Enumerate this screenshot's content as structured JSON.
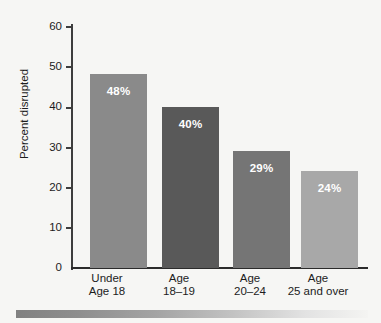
{
  "chart_data": {
    "type": "bar",
    "title": "",
    "xlabel": "",
    "ylabel": "Percent disrupted",
    "ylim": [
      0,
      60
    ],
    "yticks": [
      0,
      10,
      20,
      30,
      40,
      50,
      60
    ],
    "ytick_labels": [
      "0",
      "10",
      "20",
      "30",
      "40",
      "50",
      "60"
    ],
    "grid": false,
    "legend": "none",
    "categories": [
      "Under Age 18",
      "Age 18–19",
      "Age 20–24",
      "Age 25 and over"
    ],
    "category_lines": [
      [
        "Under",
        "Age 18"
      ],
      [
        "Age",
        "18–19"
      ],
      [
        "Age",
        "20–24"
      ],
      [
        "Age",
        "25 and over"
      ]
    ],
    "values": [
      48,
      40,
      29,
      24
    ],
    "value_labels": [
      "48%",
      "40%",
      "29%",
      "24%"
    ],
    "bar_colors": [
      "#8a8a8a",
      "#595959",
      "#757575",
      "#a8a8a8"
    ],
    "value_label_color": "#ffffff"
  },
  "figure": {
    "background_color": "#f6f6f4",
    "axis_color": "#2b2b2b",
    "text_color": "#1c1c1c",
    "bottom_rule": {
      "name": "decorative-gradient-rule",
      "from_color": "#818181",
      "to_color": "#f4f4f2"
    }
  }
}
